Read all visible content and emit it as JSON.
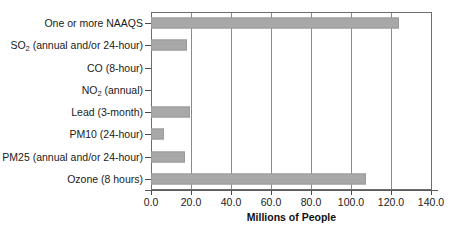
{
  "chart_data": {
    "type": "bar",
    "orientation": "horizontal",
    "title": "",
    "xlabel": "Millions of People",
    "ylabel": "",
    "xlim": [
      0.0,
      140.0
    ],
    "xticks": [
      "0.0",
      "20.0",
      "40.0",
      "60.0",
      "80.0",
      "100.0",
      "120.0",
      "140.0"
    ],
    "xtick_values": [
      0,
      20,
      40,
      60,
      80,
      100,
      120,
      140
    ],
    "grid": "vertical",
    "legend": "none",
    "bar_color": "#a8a8a8",
    "categories": [
      "One or more NAAQS",
      "SO2 (annual and/or 24-hour)",
      "CO (8-hour)",
      "NO2 (annual)",
      "Lead (3-month)",
      "PM10 (24-hour)",
      "PM25 (annual and/or 24-hour)",
      "Ozone (8 hours)"
    ],
    "category_labels_html": [
      "One or more NAAQS",
      "SO<sub>2</sub> (annual and/or 24-hour)",
      "CO (8-hour)",
      "NO<sub>2</sub> (annual)",
      "Lead (3-month)",
      "PM10 (24-hour)",
      "PM25 (annual and/or 24-hour)",
      "Ozone (8 hours)"
    ],
    "values": [
      123.5,
      17.8,
      0.0,
      0.0,
      19.6,
      6.5,
      17.0,
      107.0
    ]
  }
}
